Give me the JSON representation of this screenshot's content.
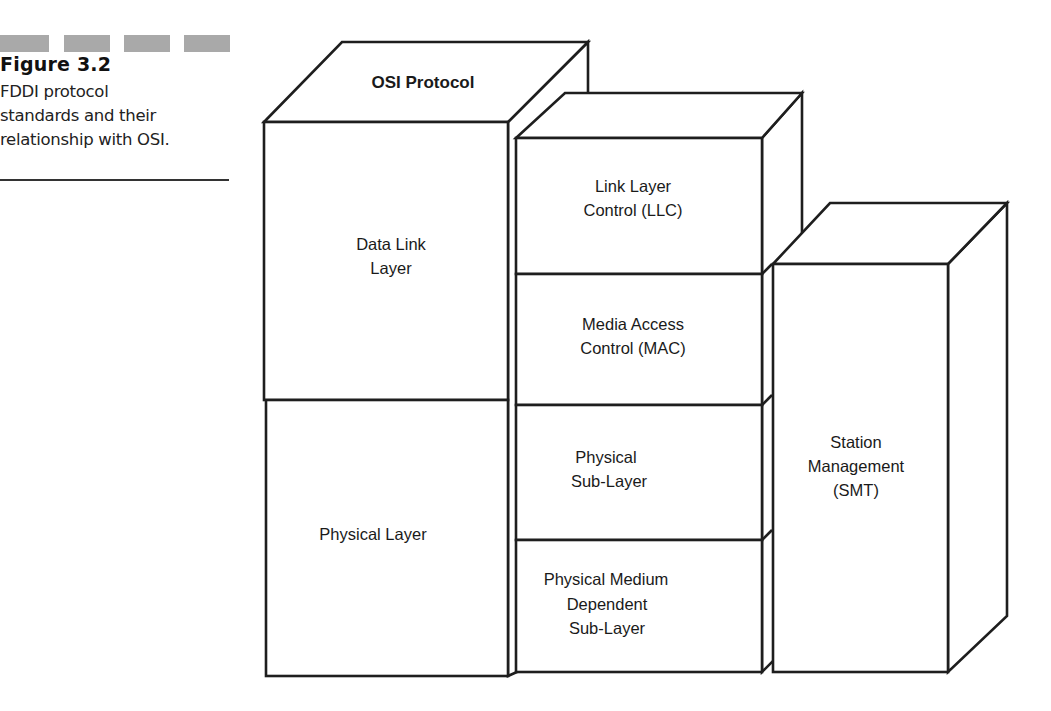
{
  "figure": {
    "number": "Figure 3.2",
    "description_lines": [
      "FDDI protocol",
      "standards and their",
      "relationship with OSI."
    ],
    "decor_dash_color": "#a9a9a9"
  },
  "diagram": {
    "osi_stack": {
      "title": "OSI Protocol",
      "layers": [
        {
          "lines": [
            "Data Link",
            "Layer"
          ]
        },
        {
          "lines": [
            "Physical Layer"
          ]
        }
      ]
    },
    "fddi_stack": {
      "layers": [
        {
          "lines": [
            "Link Layer",
            "Control (LLC)"
          ]
        },
        {
          "lines": [
            "Media Access",
            "Control (MAC)"
          ]
        },
        {
          "lines": [
            "Physical",
            "Sub-Layer"
          ]
        },
        {
          "lines": [
            "Physical Medium",
            "Dependent",
            "Sub-Layer"
          ]
        }
      ]
    },
    "smt_stack": {
      "layers": [
        {
          "lines": [
            "Station",
            "Management",
            "(SMT)"
          ]
        }
      ]
    },
    "stroke_color": "#1e1e1e",
    "fill_color": "#ffffff"
  }
}
